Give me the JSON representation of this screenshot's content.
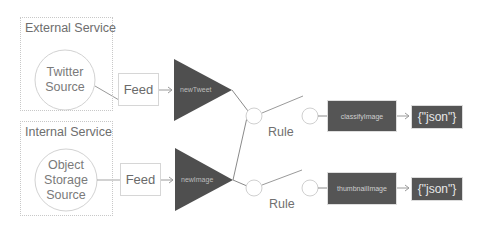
{
  "groups": [
    {
      "title": "External Service",
      "source": {
        "line1": "Twitter",
        "line2": "Source",
        "line3": ""
      }
    },
    {
      "title": "Internal Service",
      "source": {
        "line1": "Object",
        "line2": "Storage",
        "line3": "Source"
      }
    }
  ],
  "feeds": [
    {
      "label": "Feed"
    },
    {
      "label": "Feed"
    }
  ],
  "triggers": [
    {
      "label": "newTweet"
    },
    {
      "label": "newImage"
    }
  ],
  "rules": [
    {
      "label": "Rule"
    },
    {
      "label": "Rule"
    }
  ],
  "actions": [
    {
      "label": "classifyImage",
      "output": "{\"json\"}"
    },
    {
      "label": "thumbnailImage",
      "output": "{\"json\"}"
    }
  ],
  "colors": {
    "trigger_fill": "#4f4f4f",
    "action_fill": "#555555",
    "line": "#8a8a8a",
    "circle_stroke": "#d0d0d0",
    "group_border": "#c8c8c8"
  }
}
